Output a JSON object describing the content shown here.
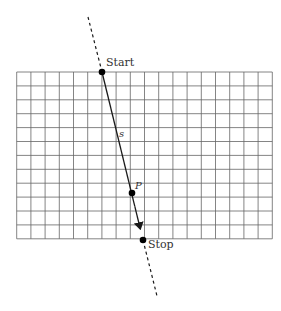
{
  "diagram": {
    "grid": {
      "left": 16.7,
      "top": 72,
      "cols": 18,
      "rows": 12,
      "cell_w": 14.2,
      "cell_h": 13.9,
      "line_color": "#666666"
    },
    "line": {
      "color": "#1a1a1a",
      "dashed_top": {
        "x1": 88,
        "y1": 17,
        "x2": 102,
        "y2": 72
      },
      "solid": {
        "x1": 102,
        "y1": 72,
        "x2": 143,
        "y2": 240
      },
      "dashed_bottom": {
        "x1": 143,
        "y1": 240,
        "x2": 157,
        "y2": 296
      }
    },
    "points": [
      {
        "id": "start",
        "label": "Start",
        "x": 102,
        "y": 72
      },
      {
        "id": "p",
        "label": "P",
        "x": 132,
        "y": 193
      },
      {
        "id": "stop",
        "label": "Stop",
        "x": 143,
        "y": 240
      }
    ],
    "labels": {
      "start": "Start",
      "stop": "Stop",
      "p": "P",
      "s": "s"
    }
  }
}
